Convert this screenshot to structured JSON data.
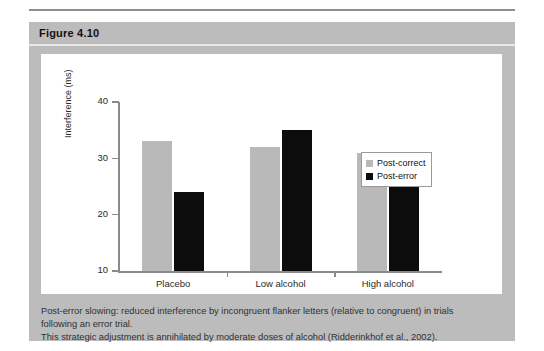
{
  "figure": {
    "header_label": "Figure 4.10",
    "caption_line1": "Post-error slowing: reduced interference by incongruent flanker letters (relative to congruent) in trials",
    "caption_line2": "following an error trial.",
    "caption_line3": "This strategic adjustment is annihilated by moderate doses of alcohol (Ridderinkhof et al., 2002)."
  },
  "colors": {
    "figure_background": "#bcbcbc",
    "panel_background": "#ffffff",
    "post_correct": "#b9b9b9",
    "post_error": "#0c0c0c",
    "axis": "#8a8a8a",
    "text": "#2b2b2b"
  },
  "chart_data": {
    "type": "bar",
    "title": "",
    "xlabel": "",
    "ylabel": "Interference (ms)",
    "categories": [
      "Placebo",
      "Low alcohol",
      "High alcohol"
    ],
    "series": [
      {
        "name": "Post-correct",
        "values": [
          33,
          32,
          31
        ],
        "color": "#b9b9b9"
      },
      {
        "name": "Post-error",
        "values": [
          24,
          35,
          29
        ],
        "color": "#0c0c0c"
      }
    ],
    "ylim": [
      10,
      40
    ],
    "yticks": [
      10,
      20,
      30,
      40
    ],
    "ytick_labels": [
      "10",
      "20",
      "30",
      "40"
    ],
    "grid": false,
    "legend_position": "right-inside",
    "baseline": 10
  }
}
